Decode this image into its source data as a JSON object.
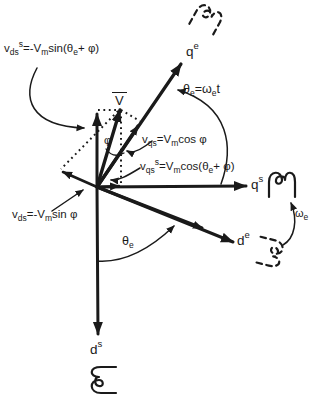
{
  "colors": {
    "ink": "#1a1a1a",
    "background": "#ffffff"
  },
  "labels": {
    "v_bar": {
      "p0": "V"
    },
    "phi": {
      "p0": "φ"
    },
    "axis_qe": {
      "p0": "q",
      "p1": "e"
    },
    "axis_qs": {
      "p0": "q",
      "p1": "s"
    },
    "axis_de": {
      "p0": "d",
      "p1": "e"
    },
    "axis_ds": {
      "p0": "d",
      "p1": "s"
    },
    "eq_vds_s": {
      "p0": "v",
      "p1": "ds",
      "p2": "s",
      "p3": "=-V",
      "p4": "m",
      "p5": "sin(θ",
      "p6": "e",
      "p7": "+ φ)"
    },
    "eq_theta_omega": {
      "p0": "θ",
      "p1": "e",
      "p2": "=ω",
      "p3": "e",
      "p4": "t"
    },
    "eq_vqs": {
      "p0": "v",
      "p1": "qs",
      "p2": "=V",
      "p3": "m",
      "p4": "cos φ"
    },
    "eq_vqs_s": {
      "p0": "v",
      "p1": "qs",
      "p2": "s",
      "p3": "=V",
      "p4": "m",
      "p5": "cos(θ",
      "p6": "e",
      "p7": "+ φ)"
    },
    "eq_vds": {
      "p0": "v",
      "p1": "ds",
      "p2": "=-V",
      "p3": "m",
      "p4": "sin φ"
    },
    "theta_e": {
      "p0": "θ",
      "p1": "e"
    },
    "omega_e": {
      "p0": "ω",
      "p1": "e"
    }
  }
}
